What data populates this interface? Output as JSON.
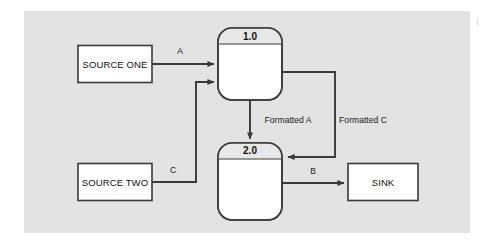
{
  "diagram": {
    "type": "data-flow-diagram",
    "background_color": "#e3e3e3",
    "line_color": "#3a3a3a",
    "shape_fill": "#ffffff",
    "process_header_fill": "#e8e8e8",
    "entities": [
      {
        "id": "source-one",
        "kind": "external-entity",
        "label": "SOURCE ONE"
      },
      {
        "id": "source-two",
        "kind": "external-entity",
        "label": "SOURCE TWO"
      },
      {
        "id": "sink",
        "kind": "external-entity",
        "label": "SINK"
      }
    ],
    "processes": [
      {
        "id": "process-1",
        "number": "1.0",
        "label": ""
      },
      {
        "id": "process-2",
        "number": "2.0",
        "label": ""
      }
    ],
    "flows": [
      {
        "id": "flow-a",
        "label": "A",
        "from": "source-one",
        "to": "process-1"
      },
      {
        "id": "flow-c",
        "label": "C",
        "from": "source-two",
        "to": "process-1"
      },
      {
        "id": "flow-formatted-a",
        "label": "Formatted A",
        "from": "process-1",
        "to": "process-2"
      },
      {
        "id": "flow-formatted-c",
        "label": "Formatted C",
        "from": "process-1",
        "to": "process-2"
      },
      {
        "id": "flow-b",
        "label": "B",
        "from": "process-2",
        "to": "sink"
      }
    ],
    "corner_mark": "("
  }
}
